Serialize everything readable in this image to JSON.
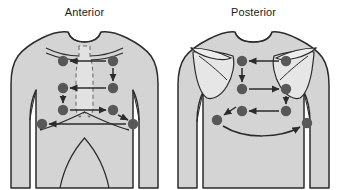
{
  "figure": {
    "background_color": "#ffffff",
    "body_fill": "#d4d4d4",
    "body_stroke": "#2b2b2b",
    "inner_fill": "#e2e2e2",
    "dot_color": "#585858",
    "arrow_color": "#2b2b2b",
    "dashed_color": "#6d6d6d"
  },
  "panels": [
    {
      "id": "anterior",
      "title": "Anterior",
      "points": [
        {
          "label": "1",
          "x": 63,
          "y": 61
        },
        {
          "label": "2",
          "x": 113,
          "y": 61
        },
        {
          "label": "3",
          "x": 63,
          "y": 88
        },
        {
          "label": "4",
          "x": 113,
          "y": 88
        },
        {
          "label": "5",
          "x": 63,
          "y": 110
        },
        {
          "label": "6",
          "x": 113,
          "y": 110
        },
        {
          "label": "7",
          "x": 42,
          "y": 124
        },
        {
          "label": "8",
          "x": 133,
          "y": 124
        }
      ]
    },
    {
      "id": "posterior",
      "title": "Posterior",
      "points": [
        {
          "label": "1",
          "x": 73,
          "y": 61
        },
        {
          "label": "2",
          "x": 117,
          "y": 61
        },
        {
          "label": "3",
          "x": 73,
          "y": 89
        },
        {
          "label": "4",
          "x": 117,
          "y": 89
        },
        {
          "label": "5",
          "x": 73,
          "y": 111
        },
        {
          "label": "6",
          "x": 117,
          "y": 111
        },
        {
          "label": "7",
          "x": 48,
          "y": 120
        },
        {
          "label": "8",
          "x": 138,
          "y": 123
        }
      ]
    }
  ]
}
